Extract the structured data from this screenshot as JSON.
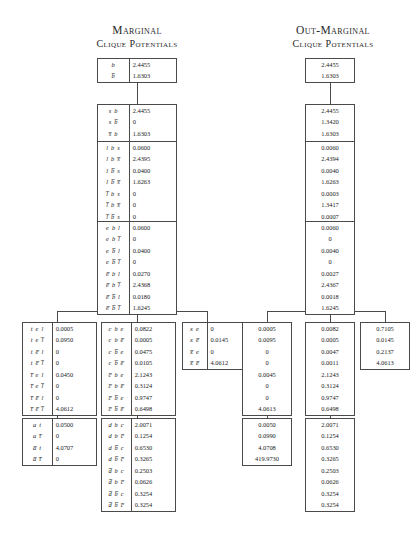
{
  "headings": {
    "left": {
      "line1": "Marginal",
      "line2": "Clique Potentials"
    },
    "right": {
      "line1": "Out-Marginal",
      "line2": "Clique Potentials"
    }
  },
  "marginal_tables": [
    {
      "id": "b",
      "labels": [
        "b",
        "b̅"
      ],
      "values": [
        "2.4455",
        "1.6303"
      ]
    },
    {
      "id": "sb",
      "labels": [
        "s b",
        "s b̅",
        "s̅ b",
        "s̅ b̅"
      ],
      "values": [
        "2.4455",
        "0",
        "1.6303",
        "0"
      ]
    },
    {
      "id": "lbs",
      "labels": [
        "l b s",
        "l b s̅",
        "l b̅ s",
        "l b̅ s̅",
        "l̅ b s",
        "l̅ b s̅",
        "l̅ b̅ s",
        "l̅ b̅ s̅"
      ],
      "values": [
        "0.0600",
        "2.4395",
        "0.0400",
        "1.6263",
        "0",
        "0",
        "0",
        "0"
      ]
    },
    {
      "id": "ebl",
      "labels": [
        "e b l",
        "e b l̅",
        "e b̅ l",
        "e b̅ l̅",
        "e̅ b l",
        "e̅ b l̅",
        "e̅ b̅ l",
        "e̅ b̅ l̅"
      ],
      "values": [
        "0.0600",
        "0",
        "0.0400",
        "0",
        "0.0270",
        "2.4368",
        "0.0180",
        "1.6245"
      ]
    },
    {
      "id": "tel",
      "labels": [
        "t e l",
        "t e l̅",
        "t e̅ l",
        "t e̅ l̅",
        "t̅ e l",
        "t̅ e l̅",
        "t̅ e̅ l",
        "t̅ e̅ l̅"
      ],
      "values": [
        "0.0005",
        "0.0950",
        "0",
        "0",
        "0.0450",
        "0",
        "0",
        "4.0612"
      ]
    },
    {
      "id": "cbe",
      "labels": [
        "c b e",
        "c b e̅",
        "c b̅ e",
        "c b̅ e̅",
        "c̅ b e",
        "c̅ b e̅",
        "c̅ b̅ e",
        "c̅ b̅ e̅"
      ],
      "values": [
        "0.0822",
        "0.0005",
        "0.0475",
        "0.0105",
        "2.1243",
        "0.3124",
        "0.9747",
        "0.6498"
      ]
    },
    {
      "id": "xe",
      "labels": [
        "x e",
        "x e̅",
        "x̅ e",
        "x̅ e̅"
      ],
      "values": [
        "0",
        "0.0145",
        "0",
        "4.0612"
      ]
    },
    {
      "id": "at",
      "labels": [
        "a t",
        "a t̅",
        "a̅ t",
        "a̅ t̅"
      ],
      "values": [
        "0.0500",
        "0",
        "4.0707",
        "0"
      ]
    },
    {
      "id": "dbc",
      "labels": [
        "d b c",
        "d b c̅",
        "d b̅ c",
        "d b̅ c̅",
        "d̅ b c",
        "d̅ b c̅",
        "d̅ b̅ c",
        "d̅ b̅ c̅"
      ],
      "values": [
        "2.0071",
        "0.1254",
        "0.6530",
        "0.3265",
        "0.2503",
        "0.0626",
        "0.3254",
        "0.3254"
      ]
    }
  ],
  "outmarginal_tables": [
    {
      "id": "b",
      "values": [
        "2.4455",
        "1.6303"
      ]
    },
    {
      "id": "sb",
      "values": [
        "2.4455",
        "1.3420",
        "1.6303",
        "3.1313"
      ]
    },
    {
      "id": "lbs",
      "values": [
        "0.0060",
        "2.4394",
        "0.0040",
        "1.6263",
        "0.0003",
        "1.3417",
        "0.0007",
        "3.1306"
      ]
    },
    {
      "id": "ebl",
      "values": [
        "0.0060",
        "0",
        "0.0040",
        "0",
        "0.0027",
        "2.4367",
        "0.0018",
        "1.6245"
      ]
    },
    {
      "id": "tel",
      "values": [
        "0.0005",
        "0.0095",
        "0",
        "0",
        "0.0045",
        "0",
        "0",
        "4.0613"
      ]
    },
    {
      "id": "cbe",
      "values": [
        "0.0082",
        "0.0005",
        "0.0047",
        "0.0011",
        "2.1243",
        "0.3124",
        "0.9747",
        "0.6498"
      ]
    },
    {
      "id": "xe",
      "values": [
        "0.7105",
        "0.0145",
        "0.2137",
        "4.0613"
      ]
    },
    {
      "id": "at",
      "values": [
        "0.0050",
        "0.0990",
        "4.0708",
        "419.9730"
      ]
    },
    {
      "id": "dbc",
      "values": [
        "2.0071",
        "0.1254",
        "0.6530",
        "0.3265",
        "0.2503",
        "0.0626",
        "0.3254",
        "0.3254"
      ]
    }
  ]
}
